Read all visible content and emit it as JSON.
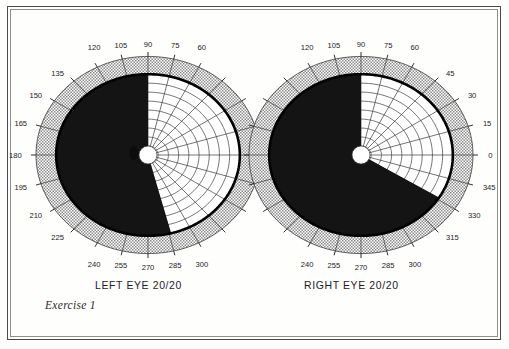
{
  "page": {
    "caption": "Exercise 1",
    "border_color": "#4a4a4a",
    "background": "#fdfdfb"
  },
  "colors": {
    "ink": "#1a1a1a",
    "grid_line": "#3a3a3a",
    "isopter": "#000000",
    "scotoma_fill": "#141414",
    "peripheral_band": "#cfcfcf",
    "field_fill": "#ffffff"
  },
  "charts": [
    {
      "id": "left-eye",
      "eye_label": "LEFT EYE",
      "acuity": "20/20",
      "center_x": 148,
      "center_y": 155,
      "radius": 112,
      "meridian_step": 15,
      "ring_count": 9,
      "band_inner_ratio": 0.82,
      "axis_labels_top": [
        "120",
        "105",
        "90",
        "75",
        "60"
      ],
      "axis_labels_left": [
        "135",
        "150",
        "165",
        "180",
        "195",
        "210",
        "225"
      ],
      "axis_labels_bottom": [
        "240",
        "255",
        "270",
        "285",
        "300"
      ],
      "axis_labels_right": [],
      "defect_start_deg": 90,
      "defect_end_deg": 287,
      "defect_name": "right-homonymous-hemianopia",
      "blind_spot": {
        "dx": -14,
        "dy": -2,
        "rx": 4.5,
        "ry": 7
      },
      "fixation": {
        "r": 9
      }
    },
    {
      "id": "right-eye",
      "eye_label": "RIGHT EYE",
      "acuity": "20/20",
      "center_x": 361,
      "center_y": 155,
      "radius": 112,
      "meridian_step": 15,
      "ring_count": 9,
      "band_inner_ratio": 0.82,
      "axis_labels_top": [
        "120",
        "105",
        "90",
        "75",
        "60"
      ],
      "axis_labels_left": [],
      "axis_labels_bottom": [
        "240",
        "255",
        "270",
        "285",
        "300"
      ],
      "axis_labels_right": [
        "45",
        "30",
        "15",
        "0",
        "345",
        "330",
        "315"
      ],
      "defect_start_deg": 90,
      "defect_end_deg": 332,
      "defect_name": "right-homonymous-hemianopia",
      "blind_spot": null,
      "fixation": {
        "r": 9
      }
    }
  ],
  "chart_data": {
    "type": "scatter",
    "title": "Exercise 1",
    "subtitle": "Binocular visual field perimetry charts",
    "xlabel": "",
    "ylabel": "",
    "grid": true,
    "legend_position": "none",
    "coordinate_system": "polar-degrees",
    "axis_range_deg": [
      0,
      360
    ],
    "radial_rings_deg": [
      10,
      20,
      30,
      40,
      50,
      60,
      70,
      80,
      90
    ],
    "meridian_tick_step_deg": 15,
    "series": [
      {
        "name": "LEFT EYE 20/20",
        "eye": "left",
        "visual_acuity": "20/20",
        "labeled_meridians": [
          "60",
          "75",
          "90",
          "105",
          "120",
          "135",
          "150",
          "165",
          "180",
          "195",
          "210",
          "225",
          "240",
          "255",
          "270",
          "285",
          "300"
        ],
        "isopter_extent_deg": {
          "0": 90,
          "15": 88,
          "30": 84,
          "45": 80,
          "60": 72,
          "75": 66,
          "90": 62,
          "105": 66,
          "120": 72,
          "135": 78,
          "150": 84,
          "165": 88,
          "180": 90,
          "195": 86,
          "210": 80,
          "225": 74,
          "240": 70,
          "255": 66,
          "270": 64,
          "285": 68,
          "300": 76,
          "315": 82,
          "330": 86,
          "345": 88
        },
        "scotoma": {
          "type": "hemianopic",
          "description": "dense absolute defect occupying the temporal-to-inferior sector",
          "sector_start_deg": 90,
          "sector_end_deg": 287,
          "fill": "#141414"
        },
        "blind_spot_present": true,
        "blind_spot_position_deg": 180,
        "fixation_spared": true
      },
      {
        "name": "RIGHT EYE 20/20",
        "eye": "right",
        "visual_acuity": "20/20",
        "labeled_meridians": [
          "0",
          "15",
          "30",
          "45",
          "60",
          "75",
          "90",
          "105",
          "120",
          "240",
          "255",
          "270",
          "285",
          "300",
          "315",
          "330",
          "345"
        ],
        "isopter_extent_deg": {
          "0": 90,
          "15": 88,
          "30": 84,
          "45": 78,
          "60": 72,
          "75": 66,
          "90": 62,
          "105": 66,
          "120": 72,
          "135": 78,
          "150": 84,
          "165": 88,
          "180": 90,
          "195": 86,
          "210": 80,
          "225": 74,
          "240": 70,
          "255": 66,
          "270": 64,
          "285": 68,
          "300": 76,
          "315": 82,
          "330": 86,
          "345": 88
        },
        "scotoma": {
          "type": "hemianopic",
          "description": "dense absolute defect occupying the nasal-to-inferior sector",
          "sector_start_deg": 90,
          "sector_end_deg": 332,
          "fill": "#141414"
        },
        "blind_spot_present": false,
        "fixation_spared": true
      }
    ]
  }
}
